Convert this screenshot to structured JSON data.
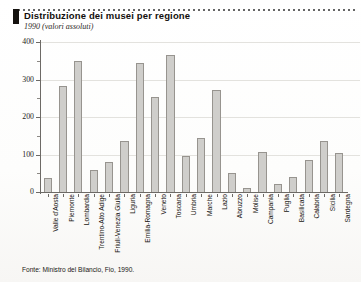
{
  "header": {
    "title": "Distribuzione dei musei per regione",
    "subtitle": "1990 (valori assoluti)",
    "marker_color": "#15120f"
  },
  "source_note": "Fonte: Ministro del Bilancio, Fio, 1990.",
  "chart_data": {
    "type": "bar",
    "title": "Distribuzione dei musei per regione",
    "subtitle": "1990 (valori assoluti)",
    "xlabel": "",
    "ylabel": "",
    "ylim": [
      0,
      400
    ],
    "yticks": [
      0,
      100,
      200,
      300,
      400
    ],
    "ytick_labels": [
      "0",
      "100",
      "200",
      "300",
      "400"
    ],
    "yminor_ticks": [
      50,
      150,
      250,
      350
    ],
    "grid": true,
    "legend": false,
    "bar_fill": "#cfcecb",
    "bar_edge": "#97948f",
    "categories": [
      "Valle d'Aosta",
      "Piemonte",
      "Lombardia",
      "Trentino-Alto Adige",
      "Friuli-Venezia Giulia",
      "Liguria",
      "Emilia-Romagna",
      "Veneto",
      "Toscana",
      "Umbria",
      "Marche",
      "Lazio",
      "Abruzzo",
      "Molise",
      "Campania",
      "Puglia",
      "Basilicata",
      "Calabria",
      "Sicilia",
      "Sardegna"
    ],
    "values": [
      38,
      283,
      350,
      58,
      80,
      137,
      343,
      253,
      365,
      95,
      143,
      272,
      52,
      10,
      108,
      22,
      40,
      85,
      137,
      105
    ]
  }
}
